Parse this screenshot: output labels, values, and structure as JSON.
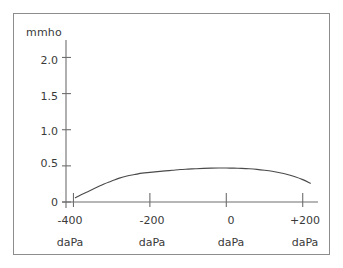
{
  "figure": {
    "border_color": "#8d8d8d",
    "background_color": "#ffffff",
    "axis_color": "#6e6e6e",
    "curve_color": "#4a4a4a",
    "text_color": "#3a3a3a"
  },
  "chart_data": {
    "type": "line",
    "title": "",
    "subtitle": "",
    "xlabel": "daPa",
    "ylabel": "mmho",
    "y_unit_label": "mmho",
    "x_unit_label": "daPa",
    "xlim": [
      -430,
      240
    ],
    "ylim": [
      0,
      2.2
    ],
    "grid": false,
    "legend": null,
    "yticks": [
      {
        "value": 2.0,
        "label": "2.0"
      },
      {
        "value": 1.5,
        "label": "1.5"
      },
      {
        "value": 1.0,
        "label": "1.0"
      },
      {
        "value": 0.5,
        "label": "0.5"
      },
      {
        "value": 0,
        "label": "0"
      }
    ],
    "xticks": [
      {
        "value": -400,
        "label": "-400",
        "unit": "daPa"
      },
      {
        "value": -200,
        "label": "-200",
        "unit": "daPa"
      },
      {
        "value": 0,
        "label": "0",
        "unit": "daPa"
      },
      {
        "value": 200,
        "label": "+200",
        "unit": "daPa"
      }
    ],
    "series": [
      {
        "name": "tympanogram",
        "x": [
          -395,
          -380,
          -360,
          -340,
          -320,
          -300,
          -280,
          -260,
          -240,
          -220,
          -200,
          -180,
          -160,
          -140,
          -120,
          -100,
          -80,
          -60,
          -40,
          -20,
          0,
          20,
          40,
          60,
          80,
          100,
          120,
          140,
          160,
          180,
          200,
          220
        ],
        "y": [
          0.06,
          0.1,
          0.15,
          0.2,
          0.25,
          0.29,
          0.33,
          0.36,
          0.38,
          0.4,
          0.41,
          0.42,
          0.43,
          0.44,
          0.45,
          0.455,
          0.46,
          0.465,
          0.468,
          0.47,
          0.47,
          0.468,
          0.465,
          0.46,
          0.452,
          0.44,
          0.425,
          0.405,
          0.38,
          0.35,
          0.31,
          0.26
        ]
      }
    ],
    "peak": {
      "x": 0,
      "y": 0.47
    },
    "annotations": []
  }
}
